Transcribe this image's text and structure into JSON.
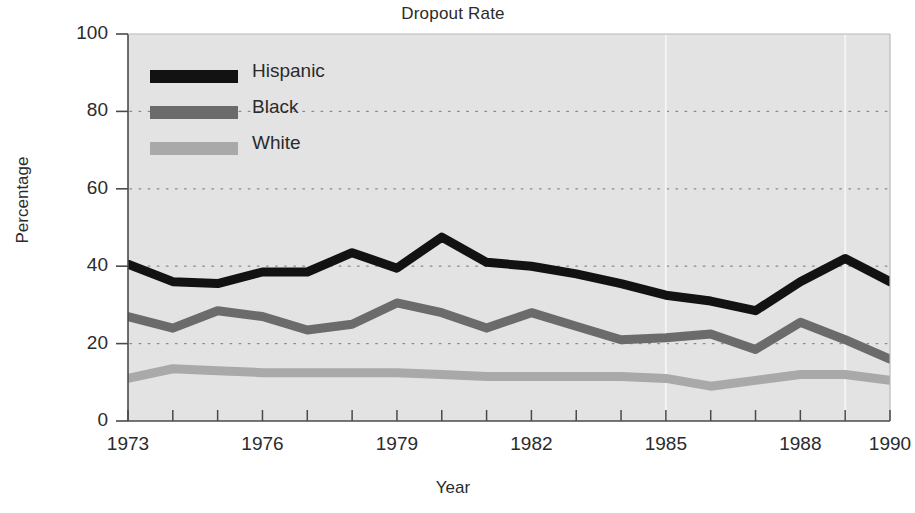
{
  "chart_data": {
    "type": "line",
    "title": "Dropout Rate",
    "xlabel": "Year",
    "ylabel": "Percentage",
    "grid": true,
    "legend_position": "top-left inside plot",
    "xlim": [
      1973,
      1990
    ],
    "ylim": [
      0,
      100
    ],
    "x": [
      1973,
      1974,
      1975,
      1976,
      1977,
      1978,
      1979,
      1980,
      1981,
      1982,
      1983,
      1984,
      1985,
      1986,
      1987,
      1988,
      1989,
      1990
    ],
    "xticks": [
      "1973",
      "1976",
      "1979",
      "1982",
      "1985",
      "1988",
      "1990"
    ],
    "xtick_values": [
      1973,
      1976,
      1979,
      1982,
      1985,
      1988,
      1990
    ],
    "yticks": [
      "0",
      "20",
      "40",
      "60",
      "80",
      "100"
    ],
    "ytick_values": [
      0,
      20,
      40,
      60,
      80,
      100
    ],
    "series": [
      {
        "name": "Hispanic",
        "color": "#121212",
        "values": [
          40.5,
          36.0,
          35.5,
          38.5,
          38.5,
          43.5,
          39.5,
          47.5,
          41.0,
          40.0,
          38.0,
          35.5,
          32.5,
          31.0,
          28.5,
          36.0,
          42.0,
          36.0
        ]
      },
      {
        "name": "Black",
        "color": "#6b6b6b",
        "values": [
          27.0,
          24.0,
          28.5,
          27.0,
          23.5,
          25.0,
          30.5,
          28.0,
          24.0,
          28.0,
          24.5,
          21.0,
          21.5,
          22.5,
          18.5,
          25.5,
          21.0,
          16.0
        ]
      },
      {
        "name": "White",
        "color": "#a9a9a9",
        "values": [
          11.0,
          13.5,
          13.0,
          12.5,
          12.5,
          12.5,
          12.5,
          12.0,
          11.5,
          11.5,
          11.5,
          11.5,
          11.0,
          9.0,
          10.5,
          12.0,
          12.0,
          10.5
        ]
      }
    ]
  },
  "legend": {
    "entries": [
      {
        "label": "Hispanic",
        "color": "#121212"
      },
      {
        "label": "Black",
        "color": "#6b6b6b"
      },
      {
        "label": "White",
        "color": "#a9a9a9"
      }
    ]
  },
  "style": {
    "plot_background": "#e3e3e3",
    "gridline_color": "#8e8e8e",
    "axis_color": "#3a3a3a",
    "text_color": "#2b2b2b"
  }
}
